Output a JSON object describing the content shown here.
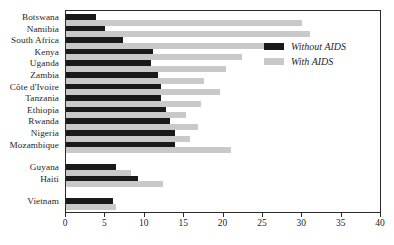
{
  "chart_data": {
    "type": "bar",
    "orientation": "horizontal",
    "title": "",
    "xlabel": "",
    "ylabel": "",
    "xlim": [
      0,
      40
    ],
    "xticks": [
      0,
      5,
      10,
      15,
      20,
      25,
      30,
      35,
      40
    ],
    "grid": false,
    "legend_position": "top-right-inside",
    "categories": [
      "Botswana",
      "Namibia",
      "South Africa",
      "Kenya",
      "Uganda",
      "Zambia",
      "Côte d'Ivoire",
      "Tanzania",
      "Ethiopia",
      "Rwanda",
      "Nigeria",
      "Mozambique",
      "Guyana",
      "Haiti",
      "Vietnam"
    ],
    "group_breaks_after": [
      "Mozambique",
      "Haiti"
    ],
    "series": [
      {
        "name": "Without AIDS",
        "color": "#1a1a1a",
        "values": [
          3.8,
          5.0,
          7.3,
          11.0,
          10.8,
          11.7,
          12.0,
          12.0,
          12.7,
          13.2,
          13.8,
          13.8,
          6.3,
          9.2,
          6.0
        ]
      },
      {
        "name": "With AIDS",
        "color": "#c9c9c9",
        "values": [
          30.0,
          31.0,
          25.8,
          22.3,
          20.3,
          17.5,
          19.5,
          17.2,
          15.3,
          16.8,
          15.8,
          21.0,
          8.3,
          12.3,
          6.3
        ]
      }
    ]
  },
  "legend": {
    "items": [
      {
        "label": "Without AIDS",
        "swatch": "without"
      },
      {
        "label": "With AIDS",
        "swatch": "with"
      }
    ]
  },
  "colors": {
    "without_aids": "#1a1a1a",
    "with_aids": "#c9c9c9",
    "frame": "#2a2a2a",
    "text": "#262626",
    "background": "#ffffff"
  }
}
